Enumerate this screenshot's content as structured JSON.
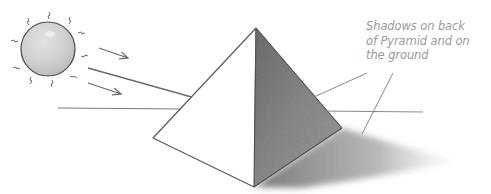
{
  "annotation": {
    "lines": [
      "Shadows on back",
      "of Pyramid and on",
      "the ground"
    ]
  },
  "scene": {
    "elements": [
      "sun",
      "light-rays",
      "pyramid",
      "horizon-line",
      "cast-shadow",
      "label-leader-lines"
    ],
    "colors": {
      "sun_fill": "#cfcfcf",
      "outline": "#555555",
      "ray": "#6a6a6a",
      "shadow": "#7a7a7a",
      "label_text": "#9a9a9a",
      "leader_line": "#8a8a8a"
    }
  }
}
